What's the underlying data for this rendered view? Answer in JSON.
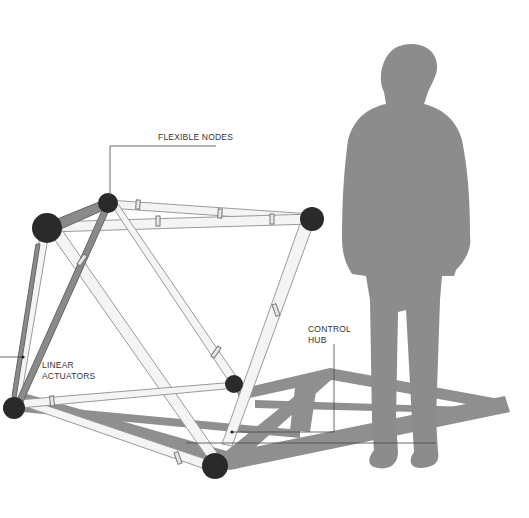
{
  "diagram": {
    "type": "technical-illustration",
    "colors": {
      "background": "#ffffff",
      "shadow": "#8f8f8f",
      "silhouette": "#8c8c8c",
      "node": "#2a2a2a",
      "strut_fill": "#f4f4f4",
      "strut_outline": "#9a9a9a",
      "actuator_dark": "#7a7a7a",
      "leader_line": "#444444"
    },
    "labels": {
      "flexible_nodes": "FLEXIBLE NODES",
      "linear_actuators_line1": "LINEAR",
      "linear_actuators_line2": "ACTUATORS",
      "control_hub_line1": "CONTROL",
      "control_hub_line2": "HUB"
    }
  }
}
